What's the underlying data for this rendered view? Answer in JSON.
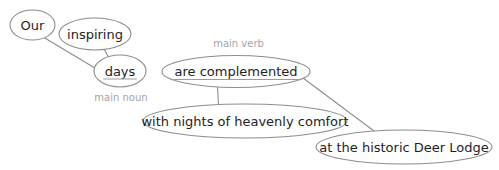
{
  "diagram": {
    "type": "sentence-diagram",
    "colors": {
      "background": "#ffffff",
      "node_fill": "#ffffff",
      "node_stroke": "#8d8d8d",
      "edge_stroke": "#8d8d8d",
      "text": "#1e1e1e",
      "underline": "#9c9c9c",
      "annotation": "#a4a4a4"
    },
    "nodes": [
      {
        "id": "our",
        "label": "Our",
        "cx": 32.5,
        "cy": 25,
        "rx": 22.5,
        "ry": 15,
        "underline": false
      },
      {
        "id": "inspiring",
        "label": "inspiring",
        "cx": 95,
        "cy": 34,
        "rx": 36,
        "ry": 16,
        "underline": false
      },
      {
        "id": "days",
        "label": "days",
        "cx": 120,
        "cy": 71,
        "rx": 26,
        "ry": 16,
        "underline": true
      },
      {
        "id": "are-complemented",
        "label": "are complemented",
        "cx": 236,
        "cy": 71.5,
        "rx": 74,
        "ry": 16,
        "underline": true
      },
      {
        "id": "with-nights-of-heavenly-comfort",
        "label": "with nights of heavenly comfort",
        "cx": 245,
        "cy": 121,
        "rx": 102,
        "ry": 17,
        "underline": false
      },
      {
        "id": "at-the-historic-deer-lodge",
        "label": "at the historic Deer Lodge",
        "cx": 404,
        "cy": 147,
        "rx": 88,
        "ry": 17,
        "underline": false
      }
    ],
    "edges": [
      {
        "from": "our",
        "to": "days",
        "x1": 44,
        "y1": 37.5,
        "x2": 94,
        "y2": 67.5
      },
      {
        "from": "inspiring",
        "to": "days",
        "x1": 102,
        "y1": 45,
        "x2": 110,
        "y2": 60
      },
      {
        "from": "are-complemented",
        "to": "with-nights-of-heavenly-comfort",
        "x1": 217.5,
        "y1": 86.5,
        "x2": 218.5,
        "y2": 105.5
      },
      {
        "from": "are-complemented",
        "to": "at-the-historic-deer-lodge",
        "x1": 303,
        "y1": 78,
        "x2": 374,
        "y2": 131
      }
    ],
    "annotations": [
      {
        "id": "main-verb",
        "text": "main verb",
        "x": 238.5,
        "y": 47
      },
      {
        "id": "main-noun",
        "text": "main noun",
        "x": 121,
        "y": 100.5
      }
    ]
  }
}
